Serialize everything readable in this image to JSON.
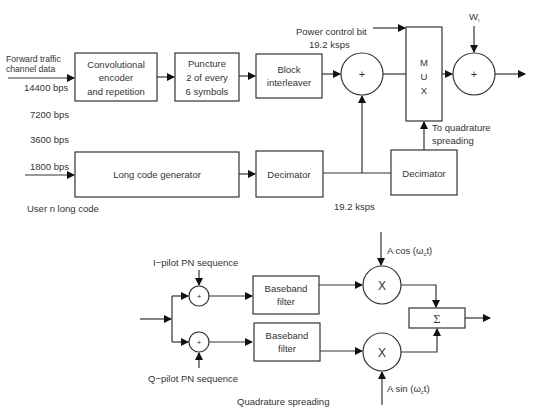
{
  "top": {
    "input_label_line1": "Forward traffic",
    "input_label_line2": "channel data",
    "rates": [
      "14400 bps",
      "7200 bps",
      "3600 bps",
      "1800 bps"
    ],
    "conv_encoder": [
      "Convolutional",
      "encoder",
      "and repetition"
    ],
    "puncture": [
      "Puncture",
      "2 of every",
      "6 symbols"
    ],
    "block_interleaver": [
      "Block",
      "interleaver"
    ],
    "sum_symbol": "+",
    "power_control": "Power control bit",
    "rate_top": "19.2 ksps",
    "mux": [
      "M",
      "U",
      "X"
    ],
    "walsh": "W",
    "walsh_sub": "i",
    "to_quadrature": [
      "To quadrature",
      "spreading"
    ],
    "long_code_gen": "Long code generator",
    "decimator1": "Decimator",
    "decimator2": "Decimator",
    "rate_bottom": "19.2 ksps",
    "user_long_code": "User n long code"
  },
  "bottom": {
    "i_pilot": "I−pilot PN sequence",
    "q_pilot": "Q−pilot PN sequence",
    "filter1": [
      "Baseband",
      "filter"
    ],
    "filter2": [
      "Baseband",
      "filter"
    ],
    "mult_symbol": "X",
    "cos_label_a": "A cos (ω",
    "cos_label_sub": "c",
    "cos_label_b": "t)",
    "sin_label_a": "A sin (ω",
    "sin_label_sub": "c",
    "sin_label_b": "t)",
    "sigma": "Σ",
    "caption": "Quadrature spreading"
  }
}
